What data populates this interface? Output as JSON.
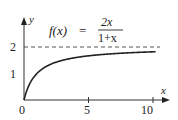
{
  "chart_data": {
    "type": "line",
    "function": "f(x) = 2x / (1 + x)",
    "xlabel": "x",
    "ylabel": "y",
    "xlim": [
      0,
      10.5
    ],
    "ylim": [
      0,
      2.5
    ],
    "xticks": [
      0,
      5,
      10
    ],
    "yticks": [
      1,
      2
    ],
    "asymptote": {
      "y": 2,
      "style": "dashed"
    },
    "grid": false,
    "series": [
      {
        "name": "f(x)",
        "x": [
          0,
          0.5,
          1,
          2,
          3,
          4,
          5,
          6,
          7,
          8,
          9,
          10
        ],
        "values": [
          0,
          0.667,
          1,
          1.333,
          1.5,
          1.6,
          1.667,
          1.714,
          1.75,
          1.778,
          1.8,
          1.818
        ]
      }
    ]
  },
  "labels": {
    "f_lhs": "f(x)",
    "eq": "=",
    "num": "2x",
    "den": "1+x",
    "x_axis": "x",
    "y_axis": "y",
    "tick_0": "0",
    "tick_5": "5",
    "tick_10": "10",
    "ytick_1": "1",
    "ytick_2": "2"
  }
}
